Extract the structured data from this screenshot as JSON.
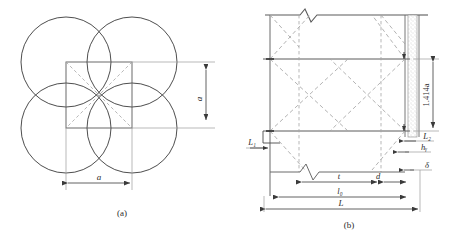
{
  "figure": {
    "background_color": "#ffffff",
    "line_color": "#3a3a3a",
    "dashed_color": "#9a9a9a",
    "hatch_color": "#b5b5b5",
    "panels": [
      {
        "id": "panel-a",
        "caption": "(a)",
        "type": "plan-four-circles",
        "description": "Four overlapping circles centred on the corners of a square, with dashed diagonals",
        "dimensions": [
          {
            "name": "width",
            "label": "a",
            "orientation": "horizontal"
          },
          {
            "name": "height",
            "label": "a",
            "orientation": "vertical"
          }
        ],
        "circle_count": 4
      },
      {
        "id": "panel-b",
        "caption": "(b)",
        "type": "elevation-braced-frame",
        "description": "Elevation of braced frame with break lines, X bracing and a hatched concrete column",
        "dimensions": [
          {
            "name": "brace-height",
            "label": "1.414a",
            "orientation": "vertical"
          },
          {
            "name": "left-offset",
            "label": "L₁",
            "orientation": "horizontal"
          },
          {
            "name": "right-offset",
            "label": "L₂",
            "orientation": "horizontal"
          },
          {
            "name": "weld-height",
            "label": "hᵧ",
            "orientation": "horizontal"
          },
          {
            "name": "plate-thickness",
            "label": "δ",
            "orientation": "horizontal"
          },
          {
            "name": "segment-t",
            "label": "t",
            "orientation": "horizontal"
          },
          {
            "name": "segment-d",
            "label": "d",
            "orientation": "horizontal"
          },
          {
            "name": "clear-span",
            "label": "l₀",
            "orientation": "horizontal"
          },
          {
            "name": "total-span",
            "label": "L",
            "orientation": "horizontal"
          }
        ]
      }
    ]
  }
}
